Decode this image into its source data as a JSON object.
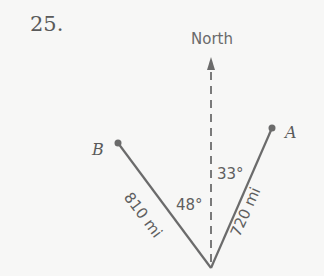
{
  "problem": {
    "number": "25."
  },
  "diagram": {
    "north_label": "North",
    "points": [
      {
        "name": "B",
        "x": 118,
        "y": 143
      },
      {
        "name": "A",
        "x": 272,
        "y": 128
      }
    ],
    "origin": {
      "x": 211,
      "y": 268
    },
    "segments": [
      {
        "to": "B",
        "distance_label": "810 mi",
        "angle_label": "48°"
      },
      {
        "to": "A",
        "distance_label": "720 mi",
        "angle_label": "33°"
      }
    ],
    "colors": {
      "line": "#6b6b6b",
      "text": "#5f5f5f",
      "background": "#f7f7f6"
    }
  }
}
